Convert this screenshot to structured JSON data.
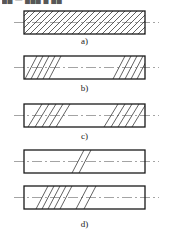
{
  "figure": {
    "title_cropped": "██ — ███ █ ██",
    "background_color": "#ffffff",
    "outline_color": "#1a1a1a",
    "hatch_color": "#333333",
    "centerline_color": "#8a8a8a",
    "canvas": {
      "width": 169,
      "height": 235
    }
  },
  "panels": [
    {
      "key": "a",
      "label": "a)",
      "description": "fully-hatched-bar",
      "rect": {
        "x": 24,
        "y": 11,
        "w": 121,
        "h": 23
      },
      "centerline": {
        "x1": 14,
        "x2": 159,
        "y": 22.5
      },
      "hatch": {
        "style": "full",
        "direction": "backslash",
        "spacing": 6,
        "count": 26
      }
    },
    {
      "key": "b",
      "label": "b)",
      "description": "bar-hatched-at-both-ends-short",
      "rect": {
        "x": 24,
        "y": 56,
        "w": 121,
        "h": 23
      },
      "centerline": {
        "x1": 14,
        "x2": 159,
        "y": 67.5
      },
      "hatch": {
        "style": "ends",
        "direction": "backslash",
        "spacing": 6,
        "left_count": 5,
        "right_count": 5,
        "left_start": 28,
        "right_start": 112
      }
    },
    {
      "key": "c",
      "label": "c)",
      "description": "bar-hatched-at-both-ends-wide",
      "rect": {
        "x": 24,
        "y": 104,
        "w": 121,
        "h": 23
      },
      "centerline": {
        "x1": 14,
        "x2": 159,
        "y": 115.5
      },
      "hatch": {
        "style": "ends",
        "direction": "backslash",
        "spacing": 7,
        "left_count": 5,
        "right_count": 5,
        "left_start": 32,
        "right_start": 108
      }
    },
    {
      "key": "d1",
      "label": "",
      "description": "bar-with-two-hatch-strokes-mid-left",
      "rect": {
        "x": 24,
        "y": 150,
        "w": 121,
        "h": 23
      },
      "centerline": {
        "x1": 14,
        "x2": 159,
        "y": 161.5
      },
      "hatch": {
        "style": "patch",
        "direction": "backslash",
        "spacing": 7,
        "count": 2,
        "start": 76
      }
    },
    {
      "key": "d2",
      "label": "d)",
      "description": "bar-with-hatch-cluster-and-two-strokes",
      "rect": {
        "x": 24,
        "y": 186,
        "w": 121,
        "h": 23
      },
      "centerline": {
        "x1": 14,
        "x2": 159,
        "y": 197.5
      },
      "hatch": {
        "style": "cluster",
        "direction": "backslash",
        "spacing": 6,
        "cluster_count": 5,
        "cluster_start": 40,
        "extra_count": 2,
        "extra_start": 80
      }
    }
  ]
}
